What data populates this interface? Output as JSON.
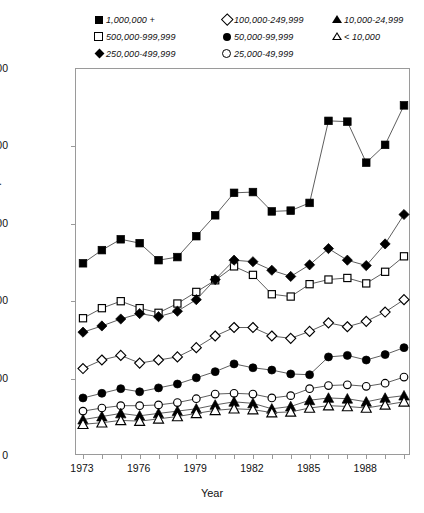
{
  "chart_data": {
    "type": "line",
    "title": "",
    "xlabel": "Year",
    "ylabel": "Per 100,000 Population",
    "xlim": [
      1973,
      1990
    ],
    "ylim": [
      0,
      2500
    ],
    "yticks": [
      0,
      500,
      1000,
      1500,
      2000,
      2500
    ],
    "ytick_labels": [
      "0",
      "500",
      "1,000",
      "1,500",
      "2,000",
      "2,500"
    ],
    "xticks": [
      1973,
      1974,
      1975,
      1976,
      1977,
      1978,
      1979,
      1980,
      1981,
      1982,
      1983,
      1984,
      1985,
      1986,
      1987,
      1988,
      1989,
      1990
    ],
    "xtick_labels": [
      "1973",
      "1976",
      "1979",
      "1982",
      "1985",
      "1988"
    ],
    "xtick_labeled_values": [
      1973,
      1976,
      1979,
      1982,
      1985,
      1988
    ],
    "grid": false,
    "legend_position": "above-plot",
    "x": [
      1973,
      1974,
      1975,
      1976,
      1977,
      1978,
      1979,
      1980,
      1981,
      1982,
      1983,
      1984,
      1985,
      1986,
      1987,
      1988,
      1989,
      1990
    ],
    "series": [
      {
        "name": "1,000,000 +",
        "marker": "square-filled",
        "values": [
          1245,
          1330,
          1400,
          1375,
          1265,
          1285,
          1420,
          1555,
          1700,
          1705,
          1580,
          1585,
          1635,
          2165,
          2160,
          1895,
          2010,
          2265
        ]
      },
      {
        "name": "500,000-999,999",
        "marker": "square-open",
        "values": [
          890,
          955,
          1000,
          955,
          925,
          985,
          1060,
          1135,
          1225,
          1170,
          1045,
          1030,
          1110,
          1140,
          1150,
          1115,
          1190,
          1290
        ]
      },
      {
        "name": "250,000-499,999",
        "marker": "diamond-filled",
        "values": [
          800,
          840,
          885,
          920,
          900,
          935,
          1010,
          1140,
          1265,
          1255,
          1200,
          1160,
          1235,
          1340,
          1265,
          1230,
          1370,
          1560
        ]
      },
      {
        "name": "100,000-249,999",
        "marker": "diamond-open",
        "values": [
          565,
          620,
          650,
          600,
          620,
          640,
          700,
          775,
          830,
          830,
          775,
          760,
          805,
          860,
          835,
          870,
          930,
          1010
        ]
      },
      {
        "name": "50,000-99,999",
        "marker": "circle-filled",
        "values": [
          375,
          405,
          435,
          415,
          440,
          465,
          505,
          545,
          595,
          570,
          555,
          530,
          525,
          640,
          650,
          620,
          655,
          700
        ]
      },
      {
        "name": "25,000-49,999",
        "marker": "circle-open",
        "values": [
          290,
          310,
          325,
          325,
          330,
          345,
          370,
          400,
          405,
          400,
          375,
          390,
          435,
          455,
          460,
          450,
          470,
          510
        ]
      },
      {
        "name": "10,000-24,999",
        "marker": "triangle-filled",
        "values": [
          235,
          255,
          275,
          260,
          275,
          290,
          305,
          330,
          350,
          340,
          305,
          320,
          360,
          375,
          370,
          350,
          375,
          390
        ]
      },
      {
        "name": "< 10,000",
        "marker": "triangle-open",
        "values": [
          205,
          215,
          230,
          225,
          240,
          255,
          275,
          295,
          305,
          300,
          280,
          285,
          310,
          325,
          320,
          310,
          330,
          350
        ]
      }
    ]
  },
  "legend": {
    "columns": [
      [
        {
          "marker": "square-filled",
          "label": "1,000,000 +"
        },
        {
          "marker": "square-open",
          "label": "500,000-999,999"
        },
        {
          "marker": "diamond-filled",
          "label": "250,000-499,999"
        }
      ],
      [
        {
          "marker": "diamond-open",
          "label": "100,000-249,999"
        },
        {
          "marker": "circle-filled",
          "label": "50,000-99,999"
        },
        {
          "marker": "circle-open",
          "label": "25,000-49,999"
        }
      ],
      [
        {
          "marker": "triangle-filled",
          "label": "10,000-24,999"
        },
        {
          "marker": "triangle-open",
          "label": "< 10,000"
        }
      ]
    ]
  },
  "colors": {
    "line": "#555555",
    "marker": "#000000",
    "axis": "#9a9a9a",
    "background": "#ffffff"
  }
}
